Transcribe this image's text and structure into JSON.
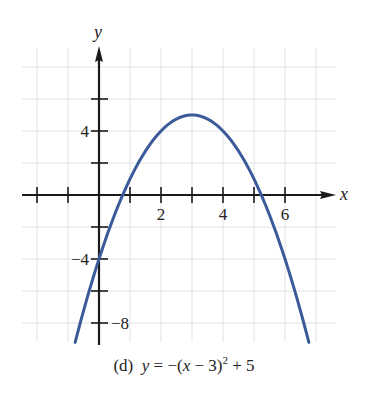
{
  "chart_data": {
    "type": "line",
    "title": "",
    "caption": {
      "label": "(d)",
      "equation_lhs": "y",
      "equation_rhs_pre": "= −(",
      "equation_var": "x",
      "equation_mid": " − 3)",
      "equation_exp": "2",
      "equation_post": " + 5"
    },
    "function": "y = -(x - 3)^2 + 5",
    "xlabel": "x",
    "ylabel": "y",
    "xlim": [
      -2,
      7.5
    ],
    "ylim": [
      -9.5,
      9
    ],
    "x_ticks": [
      -2,
      -1,
      0,
      1,
      2,
      3,
      4,
      5,
      6
    ],
    "x_tick_labels": [
      {
        "value": 2,
        "label": "2"
      },
      {
        "value": 4,
        "label": "4"
      },
      {
        "value": 6,
        "label": "6"
      }
    ],
    "y_ticks": [
      6,
      4,
      2,
      -2,
      -4,
      -6,
      -8
    ],
    "y_tick_labels": [
      {
        "value": 4,
        "label": "4"
      },
      {
        "value": -4,
        "label": "−4"
      },
      {
        "value": -8,
        "label": "−8"
      }
    ],
    "grid": true,
    "series": [
      {
        "name": "y = -(x-3)^2 + 5",
        "color": "#3a5a9a",
        "x": [
          -0.77,
          0,
          0.76,
          1,
          2,
          3,
          4,
          5,
          5.24,
          6,
          6.77
        ],
        "y": [
          -9.2,
          -4,
          0,
          1,
          4,
          5,
          4,
          1,
          0,
          -4,
          -9.2
        ]
      }
    ],
    "key_points": {
      "vertex": [
        3,
        5
      ],
      "y_intercept": [
        0,
        -4
      ],
      "x_intercepts": [
        0.76,
        5.24
      ]
    }
  },
  "colors": {
    "curve": "#3a5a9a",
    "axis": "#1a1a1a",
    "grid": "#dcdcdc"
  }
}
